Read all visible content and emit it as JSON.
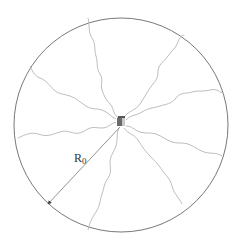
{
  "diagram": {
    "label_main": "R",
    "label_sub": "0",
    "colors": {
      "circle": "#555555",
      "wave": "#b5b5b5",
      "arrow": "#666666",
      "source": "#6a6a6a",
      "source_light": "#a0a0a0"
    },
    "waves": 8
  }
}
